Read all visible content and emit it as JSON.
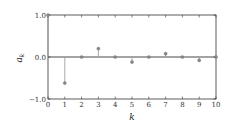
{
  "chart_data": {
    "type": "stem",
    "title": "",
    "xlabel": "k",
    "ylabel": "a_k",
    "ylabel_main": "a",
    "ylabel_sub": "k",
    "x": [
      0,
      1,
      2,
      3,
      4,
      5,
      6,
      7,
      8,
      9,
      10
    ],
    "values": [
      1.0,
      -0.62,
      0.0,
      0.2,
      0.0,
      -0.12,
      0.0,
      0.08,
      0.0,
      -0.08,
      0.0
    ],
    "xlim": [
      0,
      10
    ],
    "ylim": [
      -1.0,
      1.0
    ],
    "xticks": [
      "0",
      "1",
      "2",
      "3",
      "4",
      "5",
      "6",
      "7",
      "8",
      "9",
      "10"
    ],
    "yticks": [
      "1.0",
      "0.0",
      "−1.0"
    ],
    "ytick_values": [
      1.0,
      0.0,
      -1.0
    ],
    "grid": false,
    "baseline": 0.0,
    "colors": {
      "stem": "#a0a0a0",
      "marker": "#888888",
      "baseline": "#333333",
      "axes": "#333333"
    }
  }
}
